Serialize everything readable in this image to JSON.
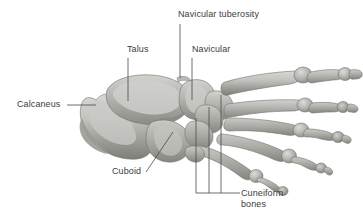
{
  "figure": {
    "view": "dorsolateral view of human foot skeleton",
    "background_color": "#ffffff",
    "bone_light_color": "#cfcfcc",
    "bone_mid_color": "#a9a9a5",
    "bone_dark_color": "#86867f",
    "bone_shadow_color": "#6f6f69",
    "leader_color": "#4a4a4a",
    "text_color": "#3c3c3c"
  },
  "labels": {
    "navicular_tuberosity": "Navicular tuberosity",
    "talus": "Talus",
    "navicular": "Navicular",
    "calcaneus": "Calcaneus",
    "cuboid": "Cuboid",
    "cuneiform_line1": "Cuneiform",
    "cuneiform_line2": "bones"
  },
  "leaders": [
    {
      "name": "navicular-tuberosity-leader",
      "type": "vertical",
      "x": 180,
      "y1": 24,
      "y2": 78
    },
    {
      "name": "talus-leader",
      "type": "vertical",
      "x": 128,
      "y1": 58,
      "y2": 101
    },
    {
      "name": "navicular-leader",
      "type": "vertical",
      "x": 192,
      "y1": 58,
      "y2": 100
    },
    {
      "name": "calcaneus-leader",
      "type": "horizontal",
      "y": 105,
      "x1": 67,
      "x2": 96
    },
    {
      "name": "cuboid-leader",
      "type": "diagonal",
      "x1": 146,
      "y1": 172,
      "x2": 173,
      "y2": 132
    },
    {
      "name": "cuneiform-leader-medial",
      "type": "vertical",
      "x": 196,
      "y1": 118,
      "y2": 193
    },
    {
      "name": "cuneiform-leader-intermediate",
      "type": "vertical",
      "x": 209,
      "y1": 107,
      "y2": 193
    },
    {
      "name": "cuneiform-leader-lateral",
      "type": "vertical",
      "x": 221,
      "y1": 95,
      "y2": 193
    },
    {
      "name": "cuneiform-leader-bracket",
      "type": "horizontal",
      "y": 193,
      "x1": 196,
      "x2": 240
    }
  ]
}
